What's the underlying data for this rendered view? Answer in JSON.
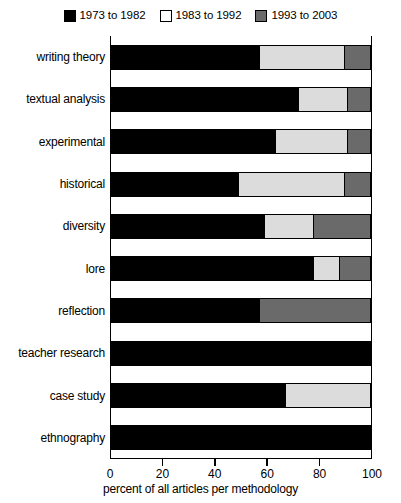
{
  "chart_data": {
    "type": "bar",
    "orientation": "horizontal",
    "stacked": true,
    "stack_mode": "percent",
    "title": "",
    "subtitle": "",
    "xlabel": "percent of all articles per methodology",
    "ylabel": "",
    "xlim": [
      0,
      100
    ],
    "xticks": [
      0,
      20,
      40,
      60,
      80,
      100
    ],
    "xticklabels": [
      "0",
      "20",
      "40",
      "60",
      "80",
      "100"
    ],
    "grid": false,
    "legend_position": "top-center",
    "categories": [
      "writing theory",
      "textual analysis",
      "experimental",
      "historical",
      "diversity",
      "lore",
      "reflection",
      "teacher research",
      "case study",
      "ethnography"
    ],
    "series": [
      {
        "name": "1973 to 1982",
        "color": "#000000",
        "values": [
          57,
          72,
          63,
          49,
          59,
          78,
          57,
          100,
          67,
          100
        ]
      },
      {
        "name": "1983 to 1992",
        "color": "#dcdcdc",
        "values": [
          33,
          19,
          28,
          41,
          19,
          10,
          0,
          0,
          33,
          0
        ]
      },
      {
        "name": "1993 to 2003",
        "color": "#6a6a6a",
        "values": [
          10,
          9,
          9,
          10,
          22,
          12,
          43,
          0,
          0,
          0
        ]
      }
    ]
  },
  "legend": {
    "entries": [
      {
        "label": "1973 to 1982",
        "color": "#000000"
      },
      {
        "label": "1983 to 1992",
        "color": "#ffffff"
      },
      {
        "label": "1993 to 2003",
        "color": "#6a6a6a"
      }
    ]
  }
}
